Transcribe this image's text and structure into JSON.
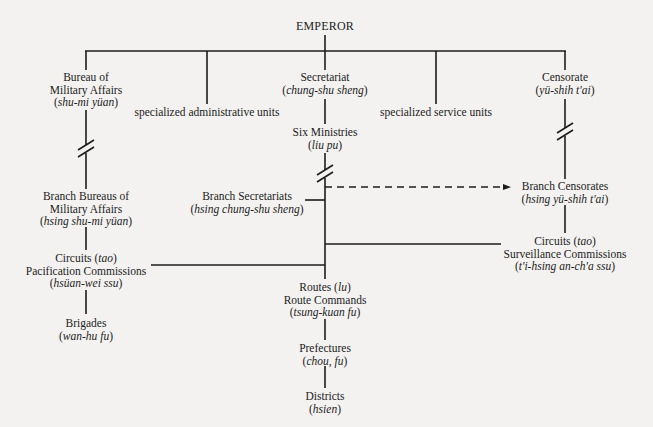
{
  "diagram": {
    "type": "organizational-chart",
    "root": {
      "label": "EMPEROR"
    },
    "nodes": {
      "bureau": {
        "line1": "Bureau of",
        "line2": "Military Affairs",
        "romanized": "shu-mi yüan"
      },
      "spec_admin": {
        "label": "specialized administrative units"
      },
      "secretariat": {
        "line1": "Secretariat",
        "romanized": "chung-shu sheng"
      },
      "six_ministries": {
        "line1": "Six Ministries",
        "romanized": "liu pu"
      },
      "spec_service": {
        "label": "specialized service units"
      },
      "censorate": {
        "line1": "Censorate",
        "romanized": "yü-shih t'ai"
      },
      "branch_bureaus": {
        "line1": "Branch Bureaus of",
        "line2": "Military Affairs",
        "romanized": "hsing shu-mi yüan"
      },
      "branch_secretariats": {
        "line1": "Branch Secretariats",
        "romanized": "hsing chung-shu sheng"
      },
      "branch_censorates": {
        "line1": "Branch Censorates",
        "romanized": "hsing yü-shih t'ai"
      },
      "circuits_pacification": {
        "circuits": "Circuits",
        "tao": "tao",
        "line2": "Pacification Commissions",
        "romanized": "hsüan-wei ssu"
      },
      "circuits_surveillance": {
        "circuits": "Circuits",
        "tao": "tao",
        "line2": "Surveillance Commissions",
        "romanized": "t'i-hsing an-ch'a ssu"
      },
      "brigades": {
        "line1": "Brigades",
        "romanized": "wan-hu fu"
      },
      "routes": {
        "routes": "Routes",
        "lu": "lu",
        "line2": "Route Commands",
        "romanized": "tsung-kuan fu"
      },
      "prefectures": {
        "line1": "Prefectures",
        "romanized": "chou, fu"
      },
      "districts": {
        "line1": "Districts",
        "romanized": "hsien"
      }
    },
    "edges": [
      {
        "from": "EMPEROR",
        "to": "bureau"
      },
      {
        "from": "EMPEROR",
        "to": "spec_admin"
      },
      {
        "from": "EMPEROR",
        "to": "secretariat"
      },
      {
        "from": "EMPEROR",
        "to": "spec_service"
      },
      {
        "from": "EMPEROR",
        "to": "censorate"
      },
      {
        "from": "secretariat",
        "to": "six_ministries"
      },
      {
        "from": "bureau",
        "to": "branch_bureaus",
        "style": "broken"
      },
      {
        "from": "six_ministries",
        "to": "branch_secretariats",
        "style": "broken"
      },
      {
        "from": "censorate",
        "to": "branch_censorates",
        "style": "broken"
      },
      {
        "from": "six_ministries",
        "to": "branch_censorates",
        "style": "dashed-arrow"
      },
      {
        "from": "branch_bureaus",
        "to": "circuits_pacification"
      },
      {
        "from": "branch_censorates",
        "to": "circuits_surveillance"
      },
      {
        "from": "branch_secretariats",
        "to": "circuits_surveillance"
      },
      {
        "from": "branch_secretariats",
        "to": "circuits_pacification"
      },
      {
        "from": "branch_secretariats",
        "to": "routes"
      },
      {
        "from": "circuits_pacification",
        "to": "brigades"
      },
      {
        "from": "routes",
        "to": "prefectures"
      },
      {
        "from": "prefectures",
        "to": "districts"
      }
    ],
    "colors": {
      "ink": "#1c1c1c",
      "paper": "#f3f2f0"
    }
  }
}
